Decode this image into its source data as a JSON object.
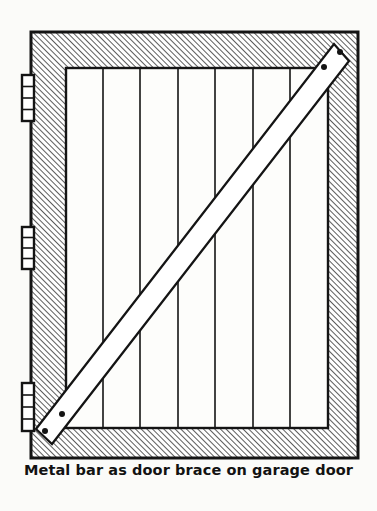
{
  "figure": {
    "title": "Metal bar as door brace on garage door",
    "caption": "Metal bar as door brace on garage door",
    "background_color": "#fbfbf9",
    "line_color": "#141414",
    "hatch_color": "#4a4a4a",
    "panel_fill": "#fdfdfb",
    "bar_fill": "#ffffff"
  },
  "frame": {
    "label": "door frame",
    "x": 31,
    "y": 32,
    "width": 327,
    "height": 426,
    "stroke_width": 3,
    "hatch_angle_degrees": 45,
    "hatch_spacing": 4
  },
  "panel": {
    "label": "door panel",
    "x": 66,
    "y": 68,
    "width": 262,
    "height": 360,
    "stroke_width": 2.4,
    "plank_count": 7,
    "plank_divider_x": [
      103,
      140,
      178,
      215,
      253,
      290
    ],
    "plank_divider_stroke_width": 1.6
  },
  "hinges": [
    {
      "label": "top hinge",
      "x": 22,
      "y": 75,
      "width": 12,
      "height": 46,
      "knuckles": 4
    },
    {
      "label": "middle hinge",
      "x": 22,
      "y": 227,
      "width": 12,
      "height": 42,
      "knuckles": 4
    },
    {
      "label": "bottom hinge",
      "x": 22,
      "y": 383,
      "width": 12,
      "height": 48,
      "knuckles": 4
    }
  ],
  "brace": {
    "label": "metal bar door brace",
    "start_x": 48,
    "start_y": 424,
    "end_x": 336,
    "end_y": 52,
    "thickness": 15,
    "stroke_width": 2.2,
    "end_cap": "angled",
    "bolt_holes": [
      {
        "label": "lower-outer-bolt",
        "x": 47,
        "y": 429,
        "r": 3.0
      },
      {
        "label": "lower-inner-bolt",
        "x": 63,
        "y": 414,
        "r": 3.0
      },
      {
        "label": "upper-inner-bolt",
        "x": 322,
        "y": 64,
        "r": 3.0
      },
      {
        "label": "upper-outer-bolt",
        "x": 337,
        "y": 48,
        "r": 3.0
      }
    ]
  }
}
